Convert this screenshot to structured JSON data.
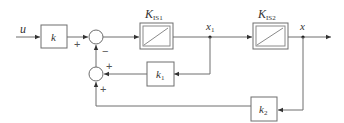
{
  "diagram": {
    "type": "block-diagram",
    "input": {
      "label": "u"
    },
    "output": {
      "label": "x"
    },
    "blocks": [
      {
        "id": "k",
        "label": "k",
        "kind": "gain"
      },
      {
        "id": "KIS1",
        "label": "K",
        "subscript": "IS1",
        "kind": "integrator"
      },
      {
        "id": "KIS2",
        "label": "K",
        "subscript": "IS2",
        "kind": "integrator"
      },
      {
        "id": "k1",
        "label": "k",
        "subscript": "1",
        "kind": "gain"
      },
      {
        "id": "k2",
        "label": "k",
        "subscript": "2",
        "kind": "gain"
      }
    ],
    "signals": [
      {
        "id": "x1",
        "label": "x",
        "subscript": "1"
      },
      {
        "id": "x",
        "label": "x"
      }
    ],
    "summers": [
      {
        "id": "sum1",
        "signs": {
          "left": "+",
          "bottom": "−"
        }
      },
      {
        "id": "sum2",
        "signs": {
          "right": "+",
          "bottom": "+"
        }
      }
    ],
    "signs": {
      "sum1_plus": "+",
      "sum1_minus": "−",
      "sum2_plus_right": "+",
      "sum2_plus_bottom": "+"
    },
    "colors": {
      "line": "#6e6e6e",
      "text": "#333333",
      "background": "#ffffff"
    }
  }
}
